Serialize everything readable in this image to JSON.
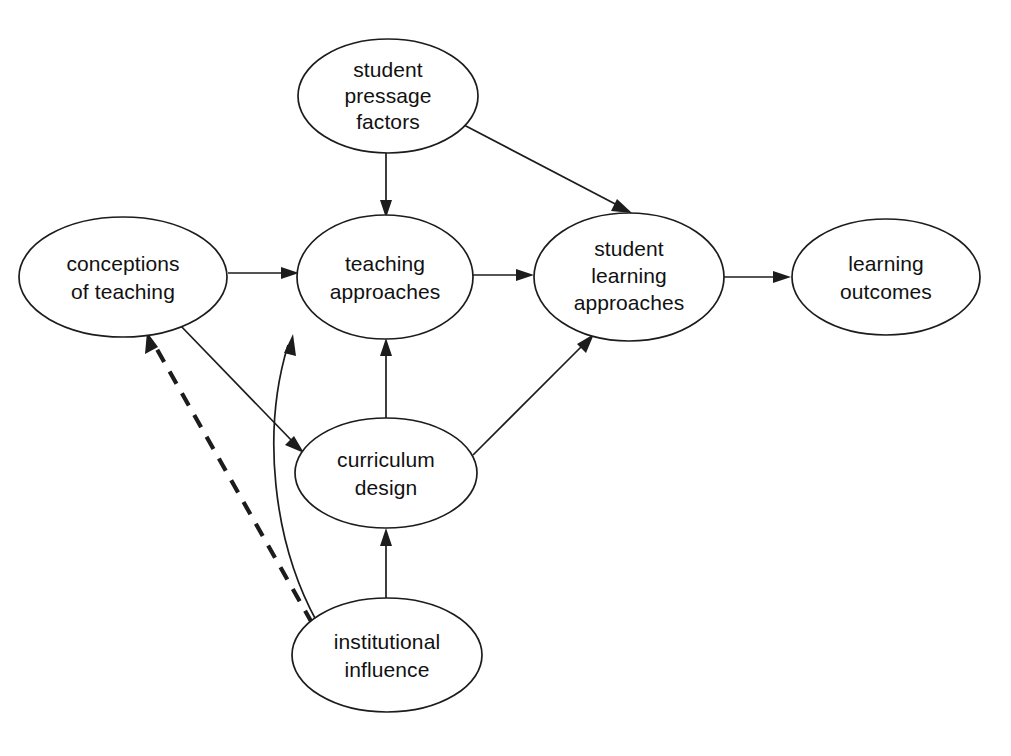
{
  "diagram": {
    "type": "flow-diagram",
    "background_color": "#ffffff",
    "line_color": "#1c1c1c",
    "text_color": "#111111",
    "nodes": [
      {
        "id": "student-pressage-factors",
        "lines": [
          "student",
          "pressage",
          "factors"
        ],
        "cx": 388,
        "cy": 96,
        "rx": 90,
        "ry": 57
      },
      {
        "id": "conceptions-of-teaching",
        "lines": [
          "conceptions",
          "of teaching"
        ],
        "cx": 123,
        "cy": 277,
        "rx": 104,
        "ry": 60
      },
      {
        "id": "teaching-approaches",
        "lines": [
          "teaching",
          "approaches"
        ],
        "cx": 385,
        "cy": 277,
        "rx": 88,
        "ry": 62
      },
      {
        "id": "student-learning-approaches",
        "lines": [
          "student",
          "learning",
          "approaches"
        ],
        "cx": 629,
        "cy": 277,
        "rx": 95,
        "ry": 64
      },
      {
        "id": "learning-outcomes",
        "lines": [
          "learning",
          "outcomes"
        ],
        "cx": 886,
        "cy": 277,
        "rx": 94,
        "ry": 58
      },
      {
        "id": "curriculum-design",
        "lines": [
          "curriculum",
          "design"
        ],
        "cx": 386,
        "cy": 473,
        "rx": 91,
        "ry": 55
      },
      {
        "id": "institutional-influence",
        "lines": [
          "institutional",
          "influence"
        ],
        "cx": 387,
        "cy": 655,
        "rx": 95,
        "ry": 57
      }
    ],
    "edges": [
      {
        "id": "pressage-to-teaching-approaches",
        "from": "student-pressage-factors",
        "to": "teaching-approaches",
        "style": "solid",
        "shape": "straight"
      },
      {
        "id": "pressage-to-student-learning",
        "from": "student-pressage-factors",
        "to": "student-learning-approaches",
        "style": "solid",
        "shape": "straight"
      },
      {
        "id": "conceptions-to-teaching-approaches",
        "from": "conceptions-of-teaching",
        "to": "teaching-approaches",
        "style": "solid",
        "shape": "straight"
      },
      {
        "id": "teaching-approaches-to-student-learning",
        "from": "teaching-approaches",
        "to": "student-learning-approaches",
        "style": "solid",
        "shape": "straight"
      },
      {
        "id": "student-learning-to-outcomes",
        "from": "student-learning-approaches",
        "to": "learning-outcomes",
        "style": "solid",
        "shape": "straight"
      },
      {
        "id": "conceptions-to-curriculum-design",
        "from": "conceptions-of-teaching",
        "to": "curriculum-design",
        "style": "solid",
        "shape": "straight"
      },
      {
        "id": "curriculum-design-to-teaching-approaches",
        "from": "curriculum-design",
        "to": "teaching-approaches",
        "style": "solid",
        "shape": "straight"
      },
      {
        "id": "curriculum-design-to-student-learning",
        "from": "curriculum-design",
        "to": "student-learning-approaches",
        "style": "solid",
        "shape": "straight"
      },
      {
        "id": "institutional-to-curriculum-design",
        "from": "institutional-influence",
        "to": "curriculum-design",
        "style": "solid",
        "shape": "straight"
      },
      {
        "id": "institutional-to-teaching-approaches",
        "from": "institutional-influence",
        "to": "teaching-approaches",
        "style": "solid",
        "shape": "curved"
      },
      {
        "id": "institutional-to-conceptions",
        "from": "institutional-influence",
        "to": "conceptions-of-teaching",
        "style": "dashed",
        "shape": "straight"
      }
    ]
  }
}
